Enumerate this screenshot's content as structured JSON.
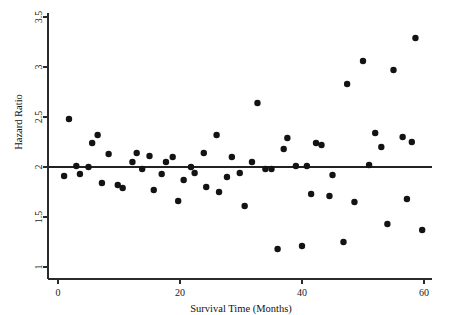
{
  "chart_data": {
    "type": "scatter",
    "title": "",
    "xlabel": "Survival Time (Months)",
    "ylabel": "Hazard Ratio",
    "xlim": [
      0,
      60
    ],
    "ylim": [
      1,
      3.5
    ],
    "xticks": [
      0,
      20,
      40,
      60
    ],
    "xticklabels": [
      "0",
      "20",
      "40",
      "60"
    ],
    "yticks": [
      1,
      1.5,
      2,
      2.5,
      3,
      3.5
    ],
    "yticklabels": [
      "1",
      "1.5",
      "2",
      "2.5",
      "3",
      "3.5"
    ],
    "grid": false,
    "legend": "none",
    "marker": "filled-circle",
    "marker_color": "#131313",
    "marker_size": 3.2,
    "reference_line": {
      "orientation": "horizontal",
      "y": 2.0,
      "color": "#222222",
      "label": ""
    },
    "series": [
      {
        "name": "Hazard Ratio by Survival Time",
        "points": [
          [
            1.0,
            1.91
          ],
          [
            1.8,
            2.48
          ],
          [
            3.0,
            2.01
          ],
          [
            3.6,
            1.93
          ],
          [
            5.0,
            2.0
          ],
          [
            5.6,
            2.24
          ],
          [
            6.5,
            2.32
          ],
          [
            7.2,
            1.84
          ],
          [
            8.3,
            2.13
          ],
          [
            9.8,
            1.82
          ],
          [
            10.6,
            1.79
          ],
          [
            12.2,
            2.05
          ],
          [
            12.9,
            2.14
          ],
          [
            13.8,
            1.98
          ],
          [
            15.0,
            2.11
          ],
          [
            15.7,
            1.77
          ],
          [
            17.0,
            1.93
          ],
          [
            17.7,
            2.05
          ],
          [
            18.8,
            2.1
          ],
          [
            19.7,
            1.66
          ],
          [
            20.6,
            1.87
          ],
          [
            21.8,
            2.0
          ],
          [
            22.4,
            1.94
          ],
          [
            23.9,
            2.14
          ],
          [
            24.3,
            1.8
          ],
          [
            26.0,
            2.32
          ],
          [
            26.4,
            1.75
          ],
          [
            27.7,
            1.9
          ],
          [
            28.5,
            2.1
          ],
          [
            29.8,
            1.94
          ],
          [
            30.6,
            1.61
          ],
          [
            31.8,
            2.05
          ],
          [
            32.7,
            2.64
          ],
          [
            34.0,
            1.98
          ],
          [
            35.0,
            1.98
          ],
          [
            36.0,
            1.18
          ],
          [
            37.0,
            2.18
          ],
          [
            37.6,
            2.29
          ],
          [
            39.0,
            2.01
          ],
          [
            40.0,
            1.21
          ],
          [
            40.8,
            2.01
          ],
          [
            41.5,
            1.73
          ],
          [
            42.3,
            2.24
          ],
          [
            43.2,
            2.22
          ],
          [
            44.5,
            1.71
          ],
          [
            45.0,
            1.92
          ],
          [
            46.8,
            1.25
          ],
          [
            47.4,
            2.83
          ],
          [
            48.6,
            1.65
          ],
          [
            50.0,
            3.06
          ],
          [
            51.0,
            2.02
          ],
          [
            52.0,
            2.34
          ],
          [
            53.0,
            2.2
          ],
          [
            54.0,
            1.43
          ],
          [
            55.0,
            2.97
          ],
          [
            56.5,
            2.3
          ],
          [
            57.2,
            1.68
          ],
          [
            58.0,
            2.25
          ],
          [
            58.6,
            3.29
          ],
          [
            59.7,
            1.37
          ]
        ]
      }
    ]
  },
  "axis": {
    "x_title": "Survival Time (Months)",
    "y_title": "Hazard Ratio"
  }
}
